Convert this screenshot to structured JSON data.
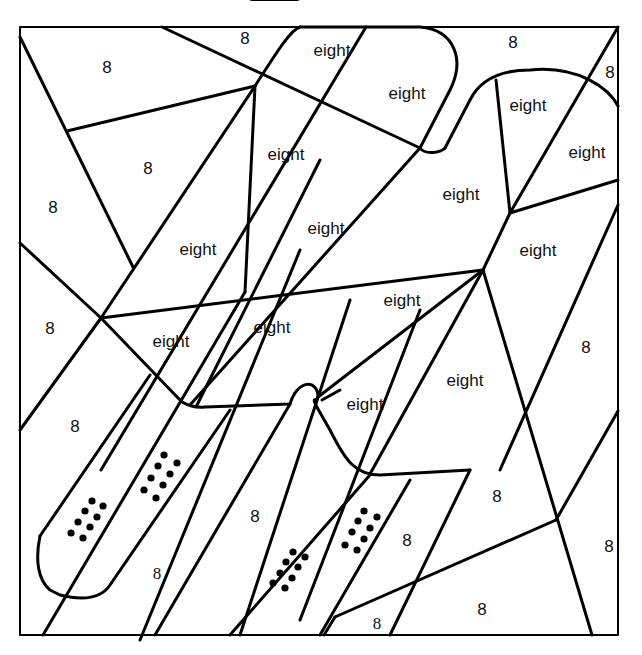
{
  "worksheet": {
    "type": "color-by-number",
    "stroke_color": "#000000",
    "background": "#ffffff",
    "labels": [
      {
        "text": "8",
        "x": 245,
        "y": 38
      },
      {
        "text": "eight",
        "x": 332,
        "y": 50
      },
      {
        "text": "8",
        "x": 513,
        "y": 42
      },
      {
        "text": "8",
        "x": 610,
        "y": 72
      },
      {
        "text": "8",
        "x": 107,
        "y": 67
      },
      {
        "text": "eight",
        "x": 407,
        "y": 93
      },
      {
        "text": "eight",
        "x": 528,
        "y": 105
      },
      {
        "text": "eight",
        "x": 587,
        "y": 152
      },
      {
        "text": "8",
        "x": 148,
        "y": 168
      },
      {
        "text": "eight",
        "x": 286,
        "y": 154
      },
      {
        "text": "eight",
        "x": 461,
        "y": 194
      },
      {
        "text": "8",
        "x": 53,
        "y": 207
      },
      {
        "text": "eight",
        "x": 326,
        "y": 228
      },
      {
        "text": "eight",
        "x": 198,
        "y": 249
      },
      {
        "text": "eight",
        "x": 538,
        "y": 250
      },
      {
        "text": "eight",
        "x": 402,
        "y": 300
      },
      {
        "text": "8",
        "x": 50,
        "y": 328
      },
      {
        "text": "eight",
        "x": 272,
        "y": 327
      },
      {
        "text": "eight",
        "x": 171,
        "y": 341
      },
      {
        "text": "8",
        "x": 586,
        "y": 347
      },
      {
        "text": "eight",
        "x": 465,
        "y": 380
      },
      {
        "text": "eight",
        "x": 365,
        "y": 404
      },
      {
        "text": "8",
        "x": 75,
        "y": 426
      },
      {
        "text": "8",
        "x": 497,
        "y": 496
      },
      {
        "text": "8",
        "x": 255,
        "y": 516
      },
      {
        "text": "8",
        "x": 407,
        "y": 540
      },
      {
        "text": "8",
        "x": 609,
        "y": 546
      },
      {
        "text": "8",
        "x": 157,
        "y": 573,
        "serif": true
      },
      {
        "text": "8",
        "x": 482,
        "y": 609
      },
      {
        "text": "8",
        "x": 377,
        "y": 623,
        "serif": true
      }
    ],
    "dot_clusters": [
      {
        "name": "dots-left",
        "dots": [
          [
            92,
            501
          ],
          [
            103,
            506
          ],
          [
            85,
            511
          ],
          [
            97,
            517
          ],
          [
            78,
            522
          ],
          [
            90,
            527
          ],
          [
            71,
            533
          ],
          [
            83,
            538
          ]
        ]
      },
      {
        "name": "dots-left-mid",
        "dots": [
          [
            164,
            455
          ],
          [
            177,
            463
          ],
          [
            158,
            466
          ],
          [
            170,
            474
          ],
          [
            151,
            478
          ],
          [
            163,
            485
          ],
          [
            144,
            490
          ],
          [
            156,
            498
          ]
        ]
      },
      {
        "name": "dots-center",
        "dots": [
          [
            293,
            552
          ],
          [
            305,
            557
          ],
          [
            286,
            562
          ],
          [
            298,
            567
          ],
          [
            280,
            573
          ],
          [
            292,
            578
          ],
          [
            273,
            583
          ],
          [
            285,
            588
          ]
        ]
      },
      {
        "name": "dots-center-right",
        "dots": [
          [
            364,
            511
          ],
          [
            377,
            517
          ],
          [
            358,
            521
          ],
          [
            370,
            528
          ],
          [
            352,
            532
          ],
          [
            364,
            539
          ],
          [
            345,
            545
          ],
          [
            357,
            550
          ]
        ]
      }
    ]
  }
}
